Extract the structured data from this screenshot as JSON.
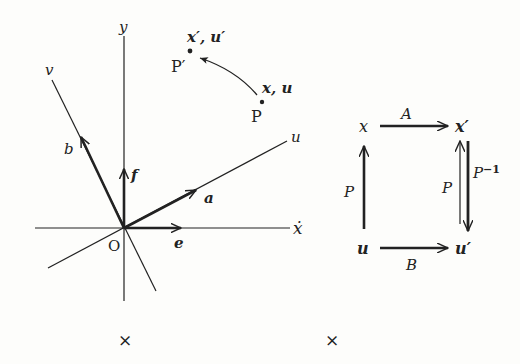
{
  "figure": {
    "left_diagram": {
      "axes": {
        "y_label": "y",
        "x_label": "ẋ",
        "v_label": "v",
        "u_label": "u",
        "origin_label": "O"
      },
      "vectors": {
        "b_label": "b",
        "f_label": "f",
        "a_label": "a",
        "e_label": "e"
      },
      "points": {
        "p_prime_coords": "x′, u′",
        "p_prime_label": "P′",
        "p_coords": "x, u",
        "p_label": "P"
      }
    },
    "commutative_diagram": {
      "nodes": {
        "top_left": "x",
        "top_right": "x′",
        "bottom_left": "u",
        "bottom_right": "u′"
      },
      "arrows": {
        "top": "A",
        "bottom": "B",
        "left": "P",
        "right_up": "P",
        "right_down": "P",
        "right_down_sup": "−1"
      }
    },
    "markers": {
      "left": "×",
      "right": "×"
    }
  }
}
